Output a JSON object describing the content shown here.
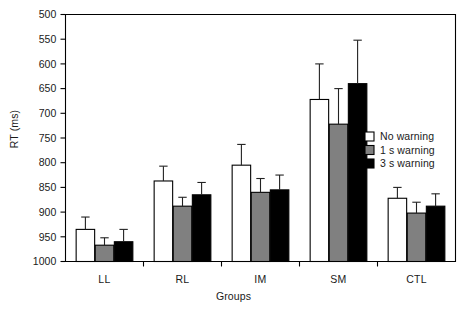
{
  "chart_data": {
    "type": "bar",
    "title": "",
    "xlabel": "Groups",
    "ylabel": "RT (ms)",
    "categories": [
      "LL",
      "RL",
      "IM",
      "SM",
      "CTL"
    ],
    "ylim": [
      500,
      1000
    ],
    "yticks": [
      500,
      550,
      600,
      650,
      700,
      750,
      800,
      850,
      900,
      950,
      1000
    ],
    "grid": false,
    "legend_position": "center right inside plot",
    "error_bars": "upper only (SEM)",
    "series": [
      {
        "name": "No warning",
        "color": "#ffffff",
        "edge_color": "#000000",
        "values": [
          565,
          663,
          695,
          828,
          628
        ],
        "errors": [
          25,
          30,
          42,
          72,
          22
        ]
      },
      {
        "name": "1 s warning",
        "color": "#808080",
        "edge_color": "#000000",
        "values": [
          533,
          612,
          640,
          778,
          598
        ],
        "errors": [
          15,
          18,
          28,
          72,
          22
        ]
      },
      {
        "name": "3 s warning",
        "color": "#000000",
        "edge_color": "#000000",
        "values": [
          540,
          635,
          645,
          860,
          612
        ],
        "errors": [
          25,
          25,
          30,
          88,
          25
        ]
      }
    ]
  },
  "axes": {
    "y_tick_labels": [
      "1000",
      "950",
      "900",
      "850",
      "800",
      "750",
      "700",
      "650",
      "600",
      "550",
      "500"
    ],
    "x_tick_labels": [
      "LL",
      "RL",
      "IM",
      "SM",
      "CTL"
    ],
    "y_axis_title": "RT (ms)",
    "x_axis_title": "Groups"
  },
  "legend": {
    "entries": [
      {
        "label": "No warning",
        "swatch": "#ffffff"
      },
      {
        "label": "1 s warning",
        "swatch": "#808080"
      },
      {
        "label": "3 s warning",
        "swatch": "#000000"
      }
    ]
  },
  "colors": {
    "axis": "#000000",
    "no_warning": "#ffffff",
    "one_s_warning": "#808080",
    "three_s_warning": "#000000",
    "background": "#ffffff"
  }
}
